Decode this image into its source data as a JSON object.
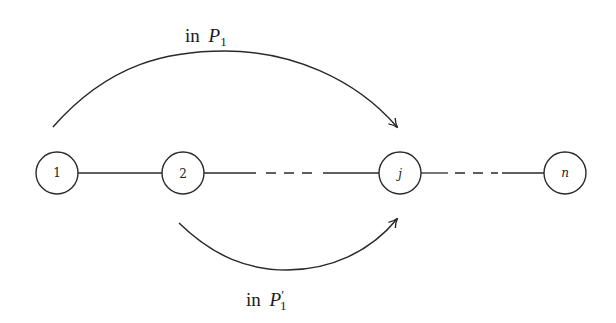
{
  "diagram": {
    "type": "path-graph",
    "nodes": [
      {
        "id": "1",
        "label": "1",
        "x": 57,
        "y": 173,
        "italic": false
      },
      {
        "id": "2",
        "label": "2",
        "x": 183,
        "y": 173,
        "italic": false
      },
      {
        "id": "j",
        "label": "j",
        "x": 400,
        "y": 173,
        "italic": true
      },
      {
        "id": "n",
        "label": "n",
        "x": 565,
        "y": 173,
        "italic": true
      }
    ],
    "edges": [
      {
        "from": "1",
        "to": "2",
        "style": "solid"
      },
      {
        "from": "2",
        "to": "j",
        "style": "solid-dashed-solid"
      },
      {
        "from": "j",
        "to": "n",
        "style": "solid-dashed-solid"
      }
    ],
    "arcs": [
      {
        "id": "top-arc",
        "label_prefix": "in ",
        "label_math": "P",
        "label_sub": "1",
        "label_prime": "",
        "from": "1",
        "to": "j",
        "direction": "over"
      },
      {
        "id": "bottom-arc",
        "label_prefix": "in ",
        "label_math": "P",
        "label_sub": "1",
        "label_prime": "′",
        "from": "2",
        "to": "j",
        "direction": "under"
      }
    ]
  }
}
